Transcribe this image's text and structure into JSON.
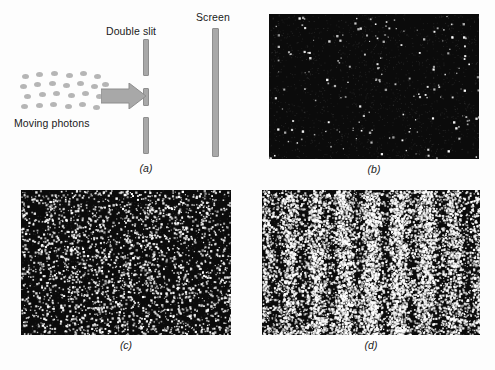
{
  "figure": {
    "background_color": "#fdfdfd",
    "ink_color": "#1a1a1a",
    "bar_color": "#a8a8a8",
    "photon_color": "#b5b5b5",
    "speckle_background": "#0b0b0b",
    "speckle_dot_color": "#ffffff"
  },
  "schematic": {
    "caption": "(a)",
    "labels": {
      "double_slit": "Double slit",
      "screen": "Screen",
      "moving_photons": "Moving photons"
    },
    "elements": {
      "arrow_name": "beam-arrow",
      "barrier_segments": 3,
      "slit_count": 2
    },
    "photon_positions": [
      [
        2,
        4
      ],
      [
        16,
        2
      ],
      [
        31,
        1
      ],
      [
        46,
        3
      ],
      [
        60,
        1
      ],
      [
        74,
        4
      ],
      [
        0,
        14
      ],
      [
        14,
        12
      ],
      [
        29,
        11
      ],
      [
        43,
        13
      ],
      [
        57,
        11
      ],
      [
        71,
        14
      ],
      [
        82,
        12
      ],
      [
        4,
        24
      ],
      [
        19,
        22
      ],
      [
        33,
        21
      ],
      [
        48,
        23
      ],
      [
        62,
        21
      ],
      [
        76,
        24
      ],
      [
        1,
        34
      ],
      [
        16,
        33
      ],
      [
        30,
        32
      ],
      [
        45,
        34
      ],
      [
        59,
        32
      ],
      [
        73,
        35
      ]
    ]
  },
  "panels": [
    {
      "id": "b",
      "caption": "(b)",
      "description": "Few photons detected - random sparse dots, no pattern visible",
      "dot_count": 170,
      "fringe_contrast": 0.0,
      "density": 0.012
    },
    {
      "id": "c",
      "caption": "(c)",
      "description": "More photons detected - faint vertical banding begins to emerge",
      "dot_count": 2600,
      "fringe_contrast": 0.35,
      "density": 0.16
    },
    {
      "id": "d",
      "caption": "(d)",
      "description": "Many photons detected - clear interference fringes",
      "dot_count": 9000,
      "fringe_contrast": 0.72,
      "density": 0.45
    }
  ],
  "chart_data": {
    "type": "scatter",
    "xlabel": "Position across screen",
    "ylabel": "Position up screen",
    "grid": false,
    "legend": "none",
    "series": [
      {
        "name": "(b) few photons",
        "detections": 170,
        "fringe_visibility": 0.0,
        "intensity_profile": [
          1,
          1,
          1,
          1,
          1,
          1,
          1,
          1,
          1,
          1,
          1,
          1,
          1
        ]
      },
      {
        "name": "(c) more photons",
        "detections": 2600,
        "fringe_visibility": 0.35,
        "intensity_profile": [
          0.75,
          1.0,
          0.75,
          0.85,
          1.1,
          0.85,
          1.3,
          0.85,
          1.1,
          0.85,
          0.75,
          1.0,
          0.75
        ]
      },
      {
        "name": "(d) many photons",
        "detections": 9000,
        "fringe_visibility": 0.72,
        "intensity_profile": [
          0.35,
          1.0,
          0.35,
          0.6,
          1.35,
          0.6,
          1.8,
          0.6,
          1.35,
          0.6,
          0.35,
          1.0,
          0.35
        ]
      }
    ],
    "fringe_spacing_fraction": 0.125
  }
}
